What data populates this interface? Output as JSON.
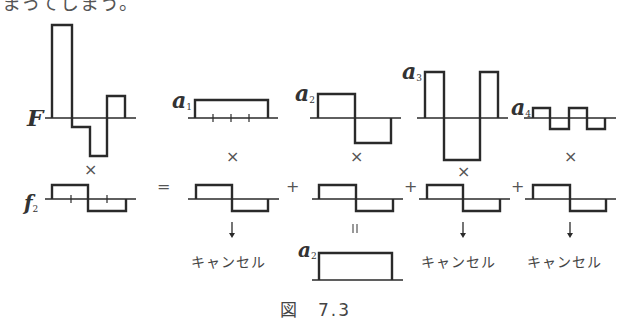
{
  "top_text": "まってしまう。",
  "labels": {
    "F": "F",
    "f2": "f",
    "f2_sub": "2",
    "a1": "a",
    "a1_sub": "1",
    "a2": "a",
    "a2_sub": "2",
    "a3": "a",
    "a3_sub": "3",
    "a4": "a",
    "a4_sub": "4",
    "a2_result": "a",
    "a2_result_sub": "2"
  },
  "operators": {
    "times": "×",
    "equals": "=",
    "plus": "+",
    "equals_vertical": "||",
    "arrow_down": "↓"
  },
  "cancel_label": "キャンセル",
  "caption": "図　7.3",
  "colors": {
    "stroke": "#2a2a2a",
    "axis": "#444444",
    "text": "#444444"
  }
}
